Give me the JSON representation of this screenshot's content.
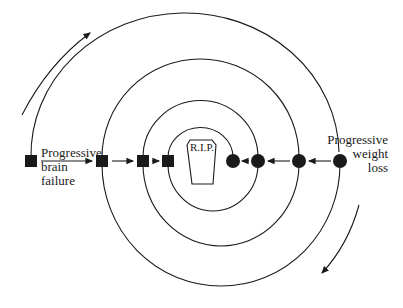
{
  "diagram": {
    "title": "",
    "center_label": "R.I.P.",
    "left_label": [
      "Progressive",
      "brain",
      "failure"
    ],
    "right_label": [
      "Progressive",
      "weight",
      "loss"
    ],
    "square_nodes_x": [
      31,
      102,
      143,
      168
    ],
    "circle_nodes_x": [
      233,
      258,
      299,
      340
    ],
    "node_row_y": 161,
    "direction_arrows": [
      "clockwise-top-left",
      "clockwise-bottom-right"
    ],
    "colors": {
      "ink": "#1a1a1a",
      "background": "#ffffff"
    }
  }
}
